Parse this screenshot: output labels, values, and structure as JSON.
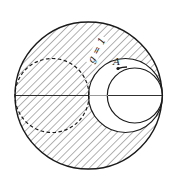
{
  "diagram": {
    "type": "smith-chart-region",
    "labels": {
      "g_circle": "g = 1",
      "point": "A"
    },
    "colors": {
      "stroke": "#1a1a1a",
      "hatch": "#444444",
      "background": "#ffffff"
    },
    "geometry": {
      "outer_circle": {
        "cx": 88.5,
        "cy": 95.5,
        "r": 74
      },
      "g1_circle": {
        "cx": 125.5,
        "cy": 95.5,
        "r": 37
      },
      "inner_circle": {
        "cx": 135,
        "cy": 95.5,
        "r": 27.5
      },
      "dashed_circle": {
        "cx": 52,
        "cy": 95.5,
        "r": 37
      },
      "point_A": {
        "x": 118,
        "y": 68.5
      },
      "horizontal_axis": {
        "x1": 15,
        "x2": 162,
        "y": 95.5
      }
    }
  }
}
